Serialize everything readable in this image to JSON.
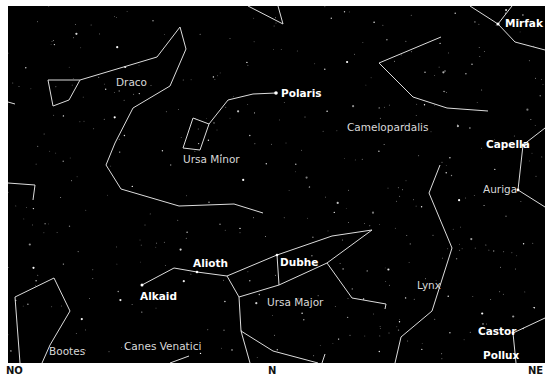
{
  "map": {
    "background": "#000000",
    "line_color": "#e0e0e0",
    "star_labels": [
      {
        "name": "Mirfak",
        "x": 505,
        "y": 17
      },
      {
        "name": "Polaris",
        "x": 281,
        "y": 87
      },
      {
        "name": "Capella",
        "x": 486,
        "y": 138
      },
      {
        "name": "Alioth",
        "x": 193,
        "y": 257
      },
      {
        "name": "Dubhe",
        "x": 280,
        "y": 256
      },
      {
        "name": "Alkaid",
        "x": 140,
        "y": 290
      },
      {
        "name": "Castor",
        "x": 478,
        "y": 325
      },
      {
        "name": "Pollux",
        "x": 483,
        "y": 349
      }
    ],
    "constellation_labels": [
      {
        "name": "Draco",
        "x": 116,
        "y": 76
      },
      {
        "name": "Ursa Minor",
        "x": 183,
        "y": 153
      },
      {
        "name": "Camelopardalis",
        "x": 347,
        "y": 121
      },
      {
        "name": "Auriga",
        "x": 483,
        "y": 183
      },
      {
        "name": "Lynx",
        "x": 417,
        "y": 279
      },
      {
        "name": "Ursa Major",
        "x": 267,
        "y": 296
      },
      {
        "name": "Bootes",
        "x": 49,
        "y": 345
      },
      {
        "name": "Canes Venatici",
        "x": 124,
        "y": 340
      }
    ],
    "directions": [
      {
        "label": "NO",
        "x": 6
      },
      {
        "label": "N",
        "x": 268
      },
      {
        "label": "NE",
        "x": 528
      }
    ]
  }
}
